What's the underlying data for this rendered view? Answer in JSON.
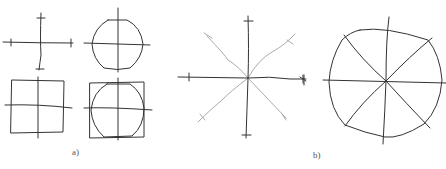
{
  "figure": {
    "panels": [
      {
        "id": "a",
        "label": "a)",
        "description": "Four sketches: cross, circle with cross, square with cross, circle inscribed in square with cross"
      },
      {
        "id": "b",
        "label": "b)",
        "description": "Eight-ray star with tick marks, and circle divided into eight sectors"
      }
    ]
  },
  "colors": {
    "stroke": "#333333",
    "light_stroke": "#aaaaaa"
  }
}
